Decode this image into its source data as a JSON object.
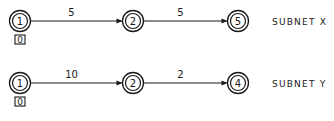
{
  "subnets": [
    {
      "name": "SUBNET X",
      "nodes": [
        {
          "id": "1",
          "label": "1"
        },
        {
          "id": "2",
          "label": "2"
        },
        {
          "id": "5",
          "label": "5"
        }
      ],
      "edges": [
        {
          "from": "1",
          "to": "2",
          "weight": "5"
        },
        {
          "from": "2",
          "to": "5",
          "weight": "5"
        }
      ],
      "start_value": "0"
    },
    {
      "name": "SUBNET Y",
      "nodes": [
        {
          "id": "1",
          "label": "1"
        },
        {
          "id": "2",
          "label": "2"
        },
        {
          "id": "4",
          "label": "4"
        }
      ],
      "edges": [
        {
          "from": "1",
          "to": "2",
          "weight": "10"
        },
        {
          "from": "2",
          "to": "4",
          "weight": "2"
        }
      ],
      "start_value": "0"
    }
  ]
}
